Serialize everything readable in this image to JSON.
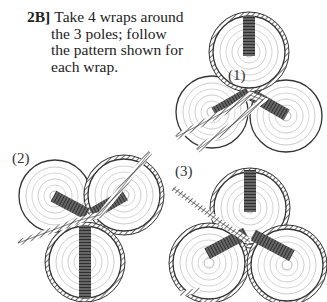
{
  "instruction": {
    "step": "2B]",
    "lines": [
      "Take 4 wraps around",
      "the 3 poles; follow",
      "the pattern shown for",
      "each wrap."
    ]
  },
  "figures": [
    {
      "label": "(1)",
      "description": "Three pole ends with rope wrapped around top pole, crossing between poles"
    },
    {
      "label": "(2)",
      "description": "Three pole ends with rope wrapped around top-right and bottom poles"
    },
    {
      "label": "(3)",
      "description": "Three pole ends with rope wrapped around all three poles"
    }
  ],
  "colors": {
    "ink": "#222222",
    "paper": "#ffffff",
    "lashing": "#555555"
  }
}
